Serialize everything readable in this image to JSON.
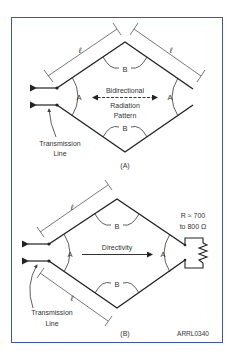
{
  "figure_id": "ARRL0340",
  "colors": {
    "frame_border": "#3e57a8",
    "line": "#222222",
    "dimension": "#555555",
    "text": "#333333",
    "background": "#ffffff"
  },
  "panel_a": {
    "caption": "(A)",
    "angle_labels": {
      "left": "A",
      "right": "A",
      "top": "B",
      "bottom": "B"
    },
    "length_labels": {
      "upper_left": "ℓ",
      "upper_right": "ℓ"
    },
    "pattern_text": [
      "Bidirectional",
      "Radiation",
      "Pattern"
    ],
    "feed_label": [
      "Transmission",
      "Line"
    ]
  },
  "panel_b": {
    "caption": "(B)",
    "angle_labels": {
      "left": "A",
      "right": "A",
      "top": "B",
      "bottom": "B"
    },
    "length_labels": {
      "upper_left": "ℓ",
      "lower_left": "ℓ"
    },
    "directivity_text": "Directivity",
    "termination_label": [
      "R ≈ 700",
      "to 800 Ω"
    ],
    "feed_label": [
      "Transmission",
      "Line"
    ],
    "credit": "ARRL0340"
  }
}
